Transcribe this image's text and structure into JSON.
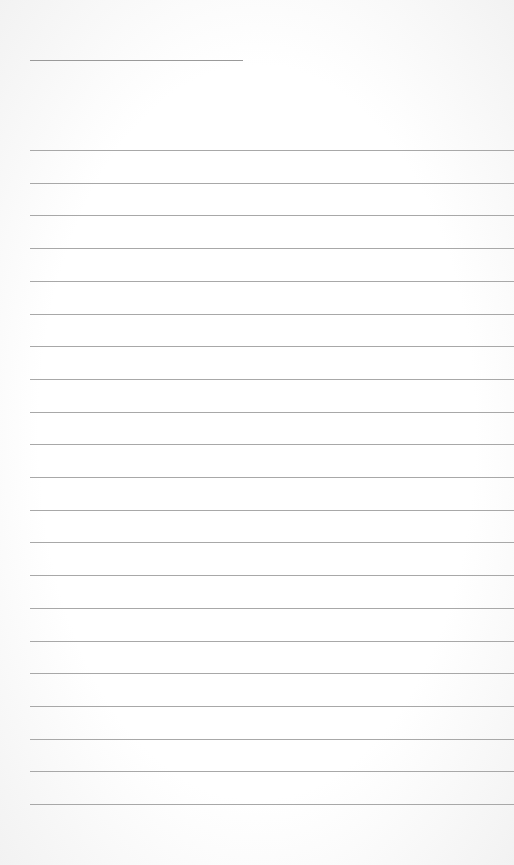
{
  "page": {
    "type": "lined-paper",
    "background": "#ffffff",
    "line_color": "#a8a8a8",
    "title_line": {
      "x": 30,
      "y": 60,
      "width": 213
    },
    "ruled_lines": {
      "count": 21,
      "start_y": 150,
      "spacing": 32.7,
      "x": 30
    }
  }
}
